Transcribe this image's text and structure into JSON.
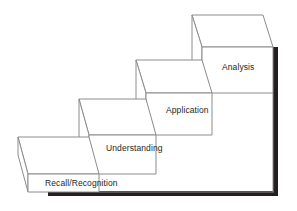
{
  "diagram": {
    "type": "isometric-staircase",
    "orientation": "ascending-left-to-right",
    "step_count": 4,
    "colors": {
      "background": "#ffffff",
      "step_stroke": "#8c8c8c",
      "step_fill": "#ffffff",
      "shadow": "#231f20",
      "text": "#231f20"
    },
    "steps": [
      {
        "index": 1,
        "label": "Recall/Recognition",
        "level": "lowest"
      },
      {
        "index": 2,
        "label": "Understanding",
        "level": "second"
      },
      {
        "index": 3,
        "label": "Application",
        "level": "third"
      },
      {
        "index": 4,
        "label": "Analysis",
        "level": "highest"
      }
    ],
    "shadow": {
      "bottom_bar": "horizontal drop shadow under lowest step",
      "right_bar": "vertical drop shadow beside highest step"
    }
  }
}
